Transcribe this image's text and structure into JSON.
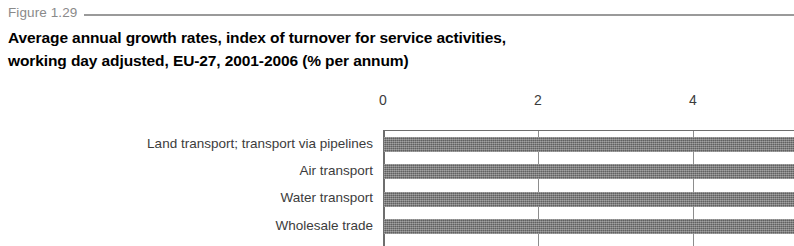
{
  "figure": {
    "number": "Figure 1.29",
    "title_line_1": "Average annual growth rates, index of turnover for service activities,",
    "title_line_2": "working day adjusted, EU-27, 2001-2006 (% per annum)"
  },
  "colors": {
    "caption_text": "#8a8a8a",
    "caption_rule": "#9a9a9a",
    "title_text": "#000000",
    "bar_fill": "#757575",
    "axis_line": "#6e6e6e",
    "gridline": "#8d8d8d",
    "label_text": "#3c3c3c"
  },
  "chart_data": {
    "type": "bar",
    "orientation": "horizontal",
    "title": "Average annual growth rates, index of turnover for service activities, working day adjusted, EU-27, 2001-2006 (% per annum)",
    "xlabel": "",
    "ylabel": "",
    "xlim": [
      0,
      5.3
    ],
    "xticks": [
      0,
      2,
      4
    ],
    "xtick_labels": [
      "0",
      "2",
      "4"
    ],
    "grid": true,
    "grid_axis": "x",
    "legend": false,
    "axis_position": "top",
    "note": "bars are clipped by the right edge of the cropped image; values shown are at least the visible extent",
    "categories": [
      "Land transport; transport via pipelines",
      "Air transport",
      "Water transport",
      "Wholesale trade"
    ],
    "values": [
      5.3,
      5.3,
      5.3,
      5.3
    ]
  }
}
